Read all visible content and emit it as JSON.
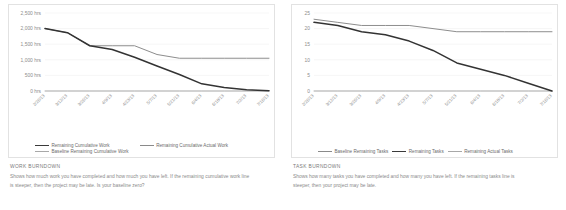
{
  "panels": [
    {
      "caption_title": "WORK BURNDOWN",
      "caption_body": "Shows how much work you have completed and how much you have left. If the remaining cumulative work line is steeper, then the project may be late. Is your baseline zero?",
      "legend": [
        {
          "label": "Remaining Cumulative Work",
          "style": "dark"
        },
        {
          "label": "Remaining Cumulative Actual Work",
          "style": "mid"
        },
        {
          "label": "Baseline Remaining Cumulative Work",
          "style": "light"
        }
      ]
    },
    {
      "caption_title": "TASK BURNDOWN",
      "caption_body": "Shows how many tasks you have completed and how many you have left. If the remaining tasks line is steeper, then your project may be late.",
      "legend": [
        {
          "label": "Baseline Remaining Tasks",
          "style": "mid"
        },
        {
          "label": "Remaining Tasks",
          "style": "dark"
        },
        {
          "label": "Remaining Actual Tasks",
          "style": "light"
        }
      ]
    }
  ],
  "chart_data": [
    {
      "type": "line",
      "title": "WORK BURNDOWN",
      "xlabel": "",
      "ylabel": "",
      "ylim": [
        0,
        2500
      ],
      "yticks": [
        0,
        500,
        1000,
        1500,
        2000,
        2500
      ],
      "ytick_labels": [
        "0 hrs",
        "500 hrs",
        "1,000 hrs",
        "1,500 hrs",
        "2,000 hrs",
        "2,500 hrs"
      ],
      "grid": true,
      "legend_position": "bottom",
      "categories": [
        "2/26/13",
        "3/12/13",
        "3/26/13",
        "4/9/13",
        "4/23/13",
        "5/7/13",
        "5/21/13",
        "6/4/13",
        "6/18/13",
        "7/2/13",
        "7/16/13"
      ],
      "series": [
        {
          "name": "Remaining Cumulative Work",
          "style": "dark",
          "values": [
            2000,
            1870,
            1450,
            1330,
            1080,
            800,
            530,
            230,
            110,
            40,
            10
          ]
        },
        {
          "name": "Remaining Cumulative Actual Work",
          "style": "mid",
          "values": [
            2000,
            1870,
            1450,
            1450,
            1450,
            1170,
            1050,
            1050,
            1050,
            1050,
            1050
          ]
        },
        {
          "name": "Baseline Remaining Cumulative Work",
          "style": "light",
          "values": [
            0,
            0,
            0,
            0,
            0,
            0,
            0,
            0,
            0,
            0,
            0
          ]
        }
      ]
    },
    {
      "type": "line",
      "title": "TASK BURNDOWN",
      "xlabel": "",
      "ylabel": "",
      "ylim": [
        0,
        25
      ],
      "yticks": [
        0,
        5,
        10,
        15,
        20,
        25
      ],
      "ytick_labels": [
        "0",
        "5",
        "10",
        "15",
        "20",
        "25"
      ],
      "grid": true,
      "legend_position": "bottom",
      "categories": [
        "2/26/13",
        "3/12/13",
        "3/26/13",
        "4/9/13",
        "4/23/13",
        "5/7/13",
        "5/21/13",
        "6/4/13",
        "6/18/13",
        "7/2/13",
        "7/16/13"
      ],
      "series": [
        {
          "name": "Baseline Remaining Tasks",
          "style": "mid",
          "values": [
            23,
            22,
            21,
            21,
            21,
            20,
            19,
            19,
            19,
            19,
            19
          ]
        },
        {
          "name": "Remaining Tasks",
          "style": "dark",
          "values": [
            22,
            21,
            19,
            18,
            16,
            13,
            9,
            7,
            5,
            2.5,
            0
          ]
        },
        {
          "name": "Remaining Actual Tasks",
          "style": "light",
          "values": [
            0,
            0,
            0,
            0,
            0,
            0,
            0,
            0,
            0,
            0,
            0
          ]
        }
      ]
    }
  ]
}
